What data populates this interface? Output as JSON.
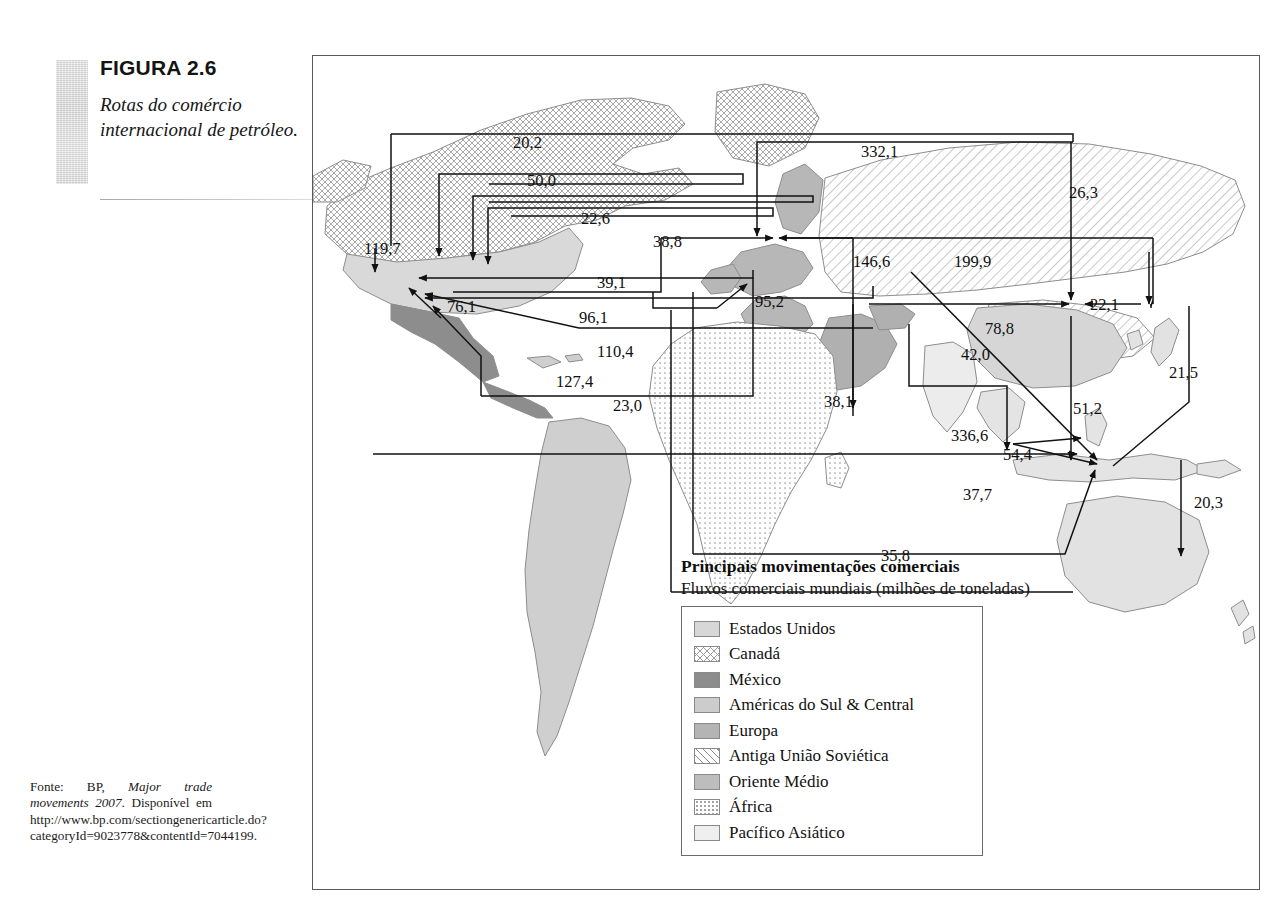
{
  "figure": {
    "number_label": "FIGURA 2.6",
    "description": "Rotas do comércio internacional de petróleo."
  },
  "source": {
    "prefix": "Fonte: BP, ",
    "title_italic": "Major trade movements 2007",
    "suffix": ". Disponível em http://www.bp.com/sectiongenericarticle.do?categoryId=9023778&contentId=7044199."
  },
  "legend": {
    "title": "Principais movimentações comerciais",
    "subtitle": "Fluxos comerciais mundiais (milhões de toneladas)",
    "items": [
      {
        "label": "Estados Unidos",
        "swatch": "us"
      },
      {
        "label": "Canadá",
        "swatch": "ca"
      },
      {
        "label": "México",
        "swatch": "mx"
      },
      {
        "label": "Américas do Sul & Central",
        "swatch": "sa"
      },
      {
        "label": "Europa",
        "swatch": "eu"
      },
      {
        "label": "Antiga União Soviética",
        "swatch": "su"
      },
      {
        "label": "Oriente Médio",
        "swatch": "me"
      },
      {
        "label": "África",
        "swatch": "af"
      },
      {
        "label": "Pacífico Asiático",
        "swatch": "ap"
      }
    ]
  },
  "chart_data": {
    "type": "diagram",
    "title": "Rotas do comércio internacional de petróleo",
    "subtitle": "Fluxos comerciais mundiais (milhões de toneladas)",
    "unit": "milhões de toneladas",
    "regions": [
      "Estados Unidos",
      "Canadá",
      "México",
      "Américas do Sul & Central",
      "Europa",
      "Antiga União Soviética",
      "Oriente Médio",
      "África",
      "Pacífico Asiático"
    ],
    "flows": [
      {
        "value": "20,2",
        "x": 512,
        "y": 132
      },
      {
        "value": "50,0",
        "x": 526,
        "y": 170
      },
      {
        "value": "22,6",
        "x": 580,
        "y": 208
      },
      {
        "value": "119,7",
        "x": 363,
        "y": 238
      },
      {
        "value": "38,8",
        "x": 652,
        "y": 231
      },
      {
        "value": "39,1",
        "x": 596,
        "y": 272
      },
      {
        "value": "76,1",
        "x": 446,
        "y": 296
      },
      {
        "value": "96,1",
        "x": 578,
        "y": 307
      },
      {
        "value": "110,4",
        "x": 596,
        "y": 341
      },
      {
        "value": "127,4",
        "x": 555,
        "y": 371
      },
      {
        "value": "23,0",
        "x": 612,
        "y": 395
      },
      {
        "value": "332,1",
        "x": 860,
        "y": 141
      },
      {
        "value": "26,3",
        "x": 1068,
        "y": 182
      },
      {
        "value": "146,6",
        "x": 852,
        "y": 251
      },
      {
        "value": "199,9",
        "x": 953,
        "y": 251
      },
      {
        "value": "95,2",
        "x": 754,
        "y": 291
      },
      {
        "value": "22,1",
        "x": 1089,
        "y": 294
      },
      {
        "value": "78,8",
        "x": 984,
        "y": 318
      },
      {
        "value": "42,0",
        "x": 960,
        "y": 344
      },
      {
        "value": "21,5",
        "x": 1168,
        "y": 362
      },
      {
        "value": "38,1",
        "x": 823,
        "y": 391
      },
      {
        "value": "51,2",
        "x": 1072,
        "y": 398
      },
      {
        "value": "336,6",
        "x": 950,
        "y": 425
      },
      {
        "value": "54,4",
        "x": 1002,
        "y": 444
      },
      {
        "value": "37,7",
        "x": 962,
        "y": 484
      },
      {
        "value": "20,3",
        "x": 1193,
        "y": 492
      },
      {
        "value": "35,8",
        "x": 880,
        "y": 545
      }
    ]
  }
}
